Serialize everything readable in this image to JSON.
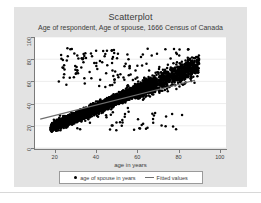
{
  "chart_data": {
    "type": "scatter",
    "title": "Scatterplot",
    "subtitle": "Age of respondent, Age of spouse, 1666 Census of Canada",
    "xlabel": "age in years",
    "ylabel": "",
    "xlim": [
      10,
      103
    ],
    "ylim": [
      0,
      100
    ],
    "xticks": [
      20,
      40,
      60,
      80,
      100
    ],
    "yticks": [
      0,
      20,
      40,
      60,
      80,
      100
    ],
    "grid": "horizontal",
    "legend_position": "bottom",
    "legend": [
      {
        "label": "age of spouse in years",
        "marker": "dot",
        "color": "#000000"
      },
      {
        "label": "Fitted values",
        "marker": "line",
        "color": "#6e6e6e"
      }
    ],
    "series": [
      {
        "name": "age of spouse in years",
        "type": "scatter",
        "marker": "filled-circle",
        "color": "#000000",
        "description": "Dense cloud of respondent age vs spouse age, concentrated between ages 20-65 with positive association and scattered outliers up to age 90."
      },
      {
        "name": "Fitted values",
        "type": "line",
        "color": "#6e6e6e",
        "x": [
          13,
          88
        ],
        "y": [
          26,
          61
        ]
      }
    ]
  },
  "colors": {
    "panel_background": "#e3e3e3",
    "plot_background": "#ffffff",
    "axis": "#7a7a7a",
    "text": "#3b3b3b",
    "marker": "#000000",
    "fit_line": "#6e6e6e"
  }
}
